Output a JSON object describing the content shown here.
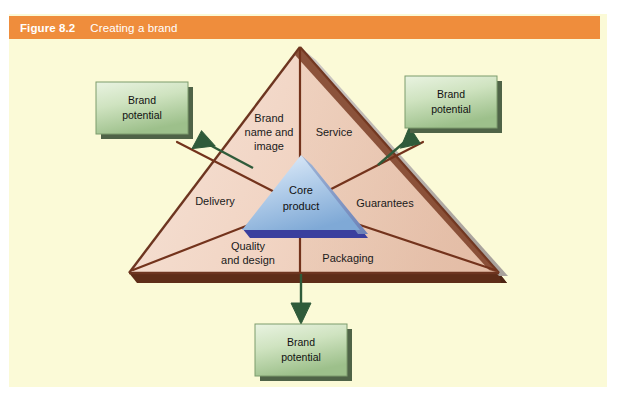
{
  "figure": {
    "number_label": "Figure 8.2",
    "title": "Creating a brand",
    "caption_bar_color": "#ef8d3c",
    "panel_color": "#fbfad7"
  },
  "diagram": {
    "type": "brand-pyramid",
    "center": {
      "label_line1": "Core",
      "label_line2": "product",
      "shape": "triangle",
      "fill_top": "#cfe0f2",
      "fill_bottom": "#8fb4dc",
      "base_shadow_color": "#3a3f9e"
    },
    "outer_triangle": {
      "fill_left": "#f2d6c6",
      "fill_right": "#e6bda8",
      "edge_color": "#6d3520",
      "base_shadow_color": "#5e2d18",
      "side_face_color": "#b9b3ae"
    },
    "sectors": [
      {
        "id": "brand-name-and-image",
        "label_lines": [
          "Brand",
          "name and",
          "image"
        ]
      },
      {
        "id": "service",
        "label_lines": [
          "Service"
        ]
      },
      {
        "id": "guarantees",
        "label_lines": [
          "Guarantees"
        ]
      },
      {
        "id": "packaging",
        "label_lines": [
          "Packaging"
        ]
      },
      {
        "id": "quality-and-design",
        "label_lines": [
          "Quality",
          "and design"
        ]
      },
      {
        "id": "delivery",
        "label_lines": [
          "Delivery"
        ]
      }
    ],
    "brand_potential_boxes": [
      {
        "id": "left",
        "label_line1": "Brand",
        "label_line2": "potential"
      },
      {
        "id": "right",
        "label_line1": "Brand",
        "label_line2": "potential"
      },
      {
        "id": "bottom",
        "label_line1": "Brand",
        "label_line2": "potential"
      }
    ],
    "box_style": {
      "fill_top": "#e2efd8",
      "fill_bottom": "#9cc08a",
      "border_color": "#7d9b6c",
      "shadow_color": "#4f6347"
    },
    "arrow_color": "#2f5b3a"
  }
}
